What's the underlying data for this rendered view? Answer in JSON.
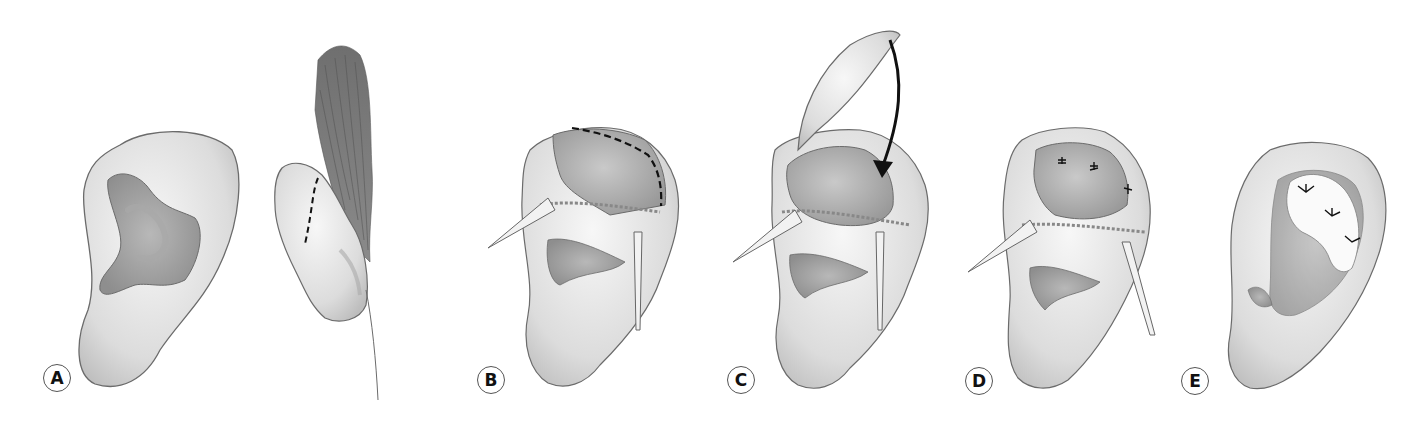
{
  "figure": {
    "panels": [
      {
        "label": "A",
        "x": 43,
        "y": 364,
        "content": "Ear front view and side view with dashed incision line"
      },
      {
        "label": "B",
        "x": 477,
        "y": 366,
        "content": "Retracted ear with dashed incision line along helix"
      },
      {
        "label": "C",
        "x": 727,
        "y": 366,
        "content": "Flap lifted with curved arrow indicating rotation"
      },
      {
        "label": "D",
        "x": 965,
        "y": 367,
        "content": "Flap sutured in place with retractors"
      },
      {
        "label": "E",
        "x": 1181,
        "y": 367,
        "content": "Final result showing graft with sutures"
      }
    ]
  },
  "colors": {
    "outline": "#6b6b6b",
    "skin_light": "#ececec",
    "skin_mid": "#cfcfcf",
    "skin_dark": "#9a9a9a",
    "hair": "#777777",
    "dashed_line": "#111111",
    "arrow": "#111111"
  }
}
